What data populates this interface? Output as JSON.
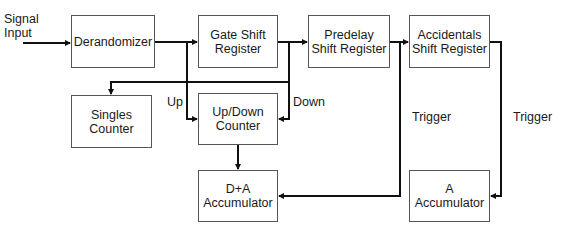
{
  "diagram": {
    "type": "block-diagram",
    "nodes": [
      {
        "id": "derandomizer",
        "label": "Derandomizer"
      },
      {
        "id": "gate",
        "label": "Gate Shift\nRegister",
        "line1": "Gate Shift",
        "line2": "Register"
      },
      {
        "id": "predelay",
        "line1": "Predelay",
        "line2": "Shift Register"
      },
      {
        "id": "accidentals",
        "line1": "Accidentals",
        "line2": "Shift Register"
      },
      {
        "id": "singles",
        "line1": "Singles",
        "line2": "Counter"
      },
      {
        "id": "updown",
        "line1": "Up/Down",
        "line2": "Counter"
      },
      {
        "id": "da_acc",
        "line1": "D+A",
        "line2": "Accumulator"
      },
      {
        "id": "a_acc",
        "line1": "A",
        "line2": "Accumulator"
      }
    ],
    "labels": {
      "signal_input_1": "Signal",
      "signal_input_2": "Input",
      "up": "Up",
      "down": "Down",
      "trigger_1": "Trigger",
      "trigger_2": "Trigger"
    },
    "edges": [
      {
        "from": "signal-input",
        "to": "derandomizer"
      },
      {
        "from": "derandomizer",
        "to": "gate"
      },
      {
        "from": "gate",
        "to": "predelay"
      },
      {
        "from": "predelay",
        "to": "accidentals"
      },
      {
        "from": "derandomizer",
        "to": "updown",
        "label": "Up"
      },
      {
        "from": "gate",
        "to": "updown",
        "label": "Down"
      },
      {
        "from": "gate",
        "to": "singles"
      },
      {
        "from": "updown",
        "to": "da_acc"
      },
      {
        "from": "predelay",
        "to": "da_acc",
        "label": "Trigger"
      },
      {
        "from": "accidentals",
        "to": "a_acc",
        "label": "Trigger"
      }
    ]
  }
}
